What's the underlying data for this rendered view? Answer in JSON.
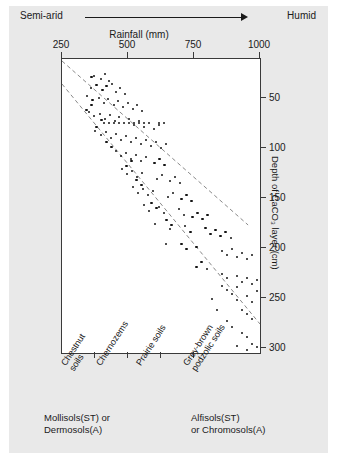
{
  "header": {
    "left_label": "Semi-arid",
    "right_label": "Humid",
    "arrow_icon": "right-arrow-icon"
  },
  "axes": {
    "x_title": "Rainfall (mm)",
    "y_title": "Depth of CaCO₃ layer (cm)",
    "x_ticks": [
      "250",
      "500",
      "750",
      "1000"
    ],
    "y_ticks": [
      "50",
      "100",
      "150",
      "200",
      "250",
      "300"
    ]
  },
  "categories": [
    {
      "label": "Chestnut\nsoils"
    },
    {
      "label": "Chernozems"
    },
    {
      "label": "Prairie soils"
    },
    {
      "label": "Grey-brown\npodzolic soils"
    }
  ],
  "classification": {
    "left": "Mollisols(ST) or\nDermosols(A)",
    "right": "Alfisols(ST)\nor Chromosols(A)"
  },
  "colors": {
    "background": "#e9e9e9",
    "plot_background": "#ffffff",
    "axis": "#3a3a3a",
    "point": "#141414",
    "envelope": "#8a8a8a"
  },
  "chart_data": {
    "type": "scatter",
    "title": "",
    "xlabel": "Rainfall (mm)",
    "ylabel": "Depth of CaCO₃ layer (cm)",
    "xlim": [
      250,
      1000
    ],
    "ylim": [
      11,
      305
    ],
    "y_inverted": true,
    "grid": false,
    "legend": null,
    "annotations": [
      {
        "text": "Semi-arid",
        "position": "top-left"
      },
      {
        "text": "Humid",
        "position": "top-right"
      }
    ],
    "envelope_lines": [
      {
        "name": "upper-bound",
        "x": [
          250,
          955
        ],
        "y": [
          13,
          177
        ],
        "style": "dashed"
      },
      {
        "name": "lower-bound",
        "x": [
          250,
          1000
        ],
        "y": [
          36,
          276
        ],
        "style": "dashed"
      }
    ],
    "points": [
      [
        362,
        29
      ],
      [
        372,
        28
      ],
      [
        398,
        31
      ],
      [
        413,
        26
      ],
      [
        429,
        33
      ],
      [
        360,
        40
      ],
      [
        381,
        37
      ],
      [
        403,
        42
      ],
      [
        418,
        38
      ],
      [
        440,
        36
      ],
      [
        455,
        44
      ],
      [
        470,
        40
      ],
      [
        489,
        46
      ],
      [
        344,
        48
      ],
      [
        365,
        52
      ],
      [
        390,
        50
      ],
      [
        409,
        55
      ],
      [
        424,
        51
      ],
      [
        447,
        57
      ],
      [
        462,
        53
      ],
      [
        481,
        59
      ],
      [
        500,
        55
      ],
      [
        519,
        61
      ],
      [
        534,
        57
      ],
      [
        553,
        63
      ],
      [
        352,
        64
      ],
      [
        371,
        68
      ],
      [
        394,
        66
      ],
      [
        413,
        71
      ],
      [
        432,
        67
      ],
      [
        451,
        73
      ],
      [
        466,
        69
      ],
      [
        485,
        75
      ],
      [
        504,
        71
      ],
      [
        523,
        77
      ],
      [
        542,
        73
      ],
      [
        561,
        79
      ],
      [
        580,
        75
      ],
      [
        599,
        81
      ],
      [
        618,
        77
      ],
      [
        375,
        83
      ],
      [
        398,
        87
      ],
      [
        417,
        84
      ],
      [
        436,
        90
      ],
      [
        455,
        86
      ],
      [
        474,
        92
      ],
      [
        493,
        88
      ],
      [
        512,
        94
      ],
      [
        531,
        90
      ],
      [
        550,
        96
      ],
      [
        569,
        92
      ],
      [
        588,
        98
      ],
      [
        607,
        94
      ],
      [
        626,
        100
      ],
      [
        645,
        96
      ],
      [
        409,
        75
      ],
      [
        428,
        75
      ],
      [
        447,
        75
      ],
      [
        466,
        75
      ],
      [
        504,
        75
      ],
      [
        523,
        75
      ],
      [
        542,
        75
      ],
      [
        561,
        75
      ],
      [
        618,
        75
      ],
      [
        637,
        75
      ],
      [
        455,
        103
      ],
      [
        474,
        108
      ],
      [
        493,
        105
      ],
      [
        512,
        111
      ],
      [
        531,
        107
      ],
      [
        550,
        113
      ],
      [
        569,
        109
      ],
      [
        600,
        115
      ],
      [
        619,
        111
      ],
      [
        638,
        117
      ],
      [
        477,
        121
      ],
      [
        496,
        126
      ],
      [
        515,
        123
      ],
      [
        534,
        129
      ],
      [
        553,
        125
      ],
      [
        610,
        131
      ],
      [
        629,
        127
      ],
      [
        660,
        133
      ],
      [
        679,
        129
      ],
      [
        698,
        135
      ],
      [
        519,
        139
      ],
      [
        538,
        145
      ],
      [
        557,
        141
      ],
      [
        576,
        147
      ],
      [
        595,
        143
      ],
      [
        652,
        149
      ],
      [
        671,
        145
      ],
      [
        702,
        151
      ],
      [
        721,
        147
      ],
      [
        740,
        153
      ],
      [
        560,
        157
      ],
      [
        579,
        163
      ],
      [
        617,
        159
      ],
      [
        636,
        165
      ],
      [
        694,
        161
      ],
      [
        713,
        167
      ],
      [
        744,
        169
      ],
      [
        763,
        165
      ],
      [
        782,
        171
      ],
      [
        801,
        167
      ],
      [
        602,
        176
      ],
      [
        660,
        181
      ],
      [
        717,
        178
      ],
      [
        736,
        184
      ],
      [
        794,
        180
      ],
      [
        813,
        186
      ],
      [
        832,
        182
      ],
      [
        851,
        188
      ],
      [
        870,
        184
      ],
      [
        889,
        190
      ],
      [
        644,
        196
      ],
      [
        759,
        199
      ],
      [
        855,
        203
      ],
      [
        874,
        207
      ],
      [
        893,
        201
      ],
      [
        912,
        209
      ],
      [
        931,
        205
      ],
      [
        950,
        211
      ],
      [
        969,
        207
      ],
      [
        800,
        221
      ],
      [
        855,
        226
      ],
      [
        874,
        230
      ],
      [
        912,
        228
      ],
      [
        931,
        234
      ],
      [
        950,
        230
      ],
      [
        969,
        236
      ],
      [
        988,
        232
      ],
      [
        893,
        246
      ],
      [
        912,
        252
      ],
      [
        950,
        248
      ],
      [
        969,
        254
      ],
      [
        855,
        238
      ],
      [
        874,
        242
      ],
      [
        931,
        262
      ],
      [
        950,
        266
      ],
      [
        969,
        271
      ],
      [
        912,
        239
      ],
      [
        988,
        243
      ],
      [
        931,
        285
      ],
      [
        950,
        289
      ],
      [
        969,
        296
      ],
      [
        988,
        299
      ],
      [
        950,
        302
      ],
      [
        912,
        298
      ],
      [
        874,
        273
      ],
      [
        893,
        279
      ],
      [
        836,
        262
      ],
      [
        817,
        251
      ],
      [
        760,
        219
      ],
      [
        779,
        214
      ],
      [
        703,
        196
      ],
      [
        722,
        201
      ],
      [
        646,
        172
      ],
      [
        665,
        177
      ],
      [
        589,
        155
      ],
      [
        608,
        160
      ],
      [
        532,
        132
      ],
      [
        551,
        137
      ],
      [
        494,
        118
      ],
      [
        513,
        113
      ],
      [
        437,
        99
      ],
      [
        418,
        94
      ],
      [
        380,
        79
      ],
      [
        399,
        72
      ],
      [
        343,
        62
      ],
      [
        362,
        57
      ]
    ]
  }
}
